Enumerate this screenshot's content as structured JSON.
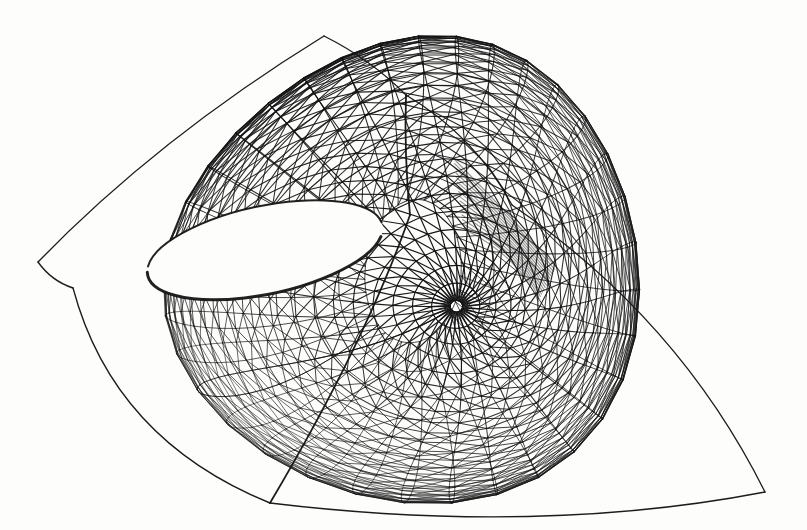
{
  "figure": {
    "domain_kind": "mathematical-surface-plot",
    "caption": "",
    "background_color": "#fdfdfc",
    "line_color": "#151515",
    "render_style": "wireframe-triangulated-quad-mesh",
    "scan_quality": "halftone-scan-grayscale"
  },
  "canvas": {
    "width": 807,
    "height": 530,
    "label": "surface-canvas"
  },
  "chart_data": {
    "type": "line",
    "subtitle": "",
    "xlabel": "",
    "ylabel": "",
    "grid": false,
    "legend": false,
    "axes_visible": false,
    "tick_labels": [],
    "projection": {
      "kind": "orthographic",
      "azimuth_deg": 34,
      "elevation_deg": 21,
      "roll_deg": 0,
      "scale": 196,
      "center_x": 404,
      "center_y": 268
    },
    "mesh": {
      "u_divisions": 34,
      "v_divisions": 34,
      "u_range": [
        -1.0,
        1.0
      ],
      "v_range": [
        -1.0,
        1.0
      ],
      "triangulation": "quad-split-forward-diagonal",
      "line_width": 1.0,
      "surface_family": "cross-cap-whitney-umbrella",
      "coefficients": {
        "a": 1.0,
        "b": 1.0,
        "c": 0.62,
        "twist": 1.0,
        "fold_gain": 0.86,
        "cusp_sharpness": 1.42
      }
    },
    "landmarks": [
      {
        "name": "upper-apex",
        "x": 324,
        "y": 36,
        "note": "highest peak of upper sheet"
      },
      {
        "name": "secondary-peak",
        "x": 406,
        "y": 95,
        "note": "second cusp ridge"
      },
      {
        "name": "left-upper-tip",
        "x": 38,
        "y": 262,
        "note": "sharp left cusp of upper sheet"
      },
      {
        "name": "left-lower-corner",
        "x": 73,
        "y": 288,
        "note": "left corner of lower sheet"
      },
      {
        "name": "fold-crease",
        "x": 512,
        "y": 205,
        "note": "dark compressed fold band"
      },
      {
        "name": "self-intersection",
        "x": 410,
        "y": 215,
        "note": "sheets cross here"
      },
      {
        "name": "bottom-corner",
        "x": 270,
        "y": 503,
        "note": "lower-left bottom vertex"
      },
      {
        "name": "right-tip",
        "x": 765,
        "y": 492,
        "note": "far right pinch tip"
      },
      {
        "name": "hole-center",
        "x": 265,
        "y": 250,
        "note": "white aperture between sheets"
      }
    ],
    "aperture": {
      "name": "white-hole",
      "center_x": 265,
      "center_y": 250,
      "radius_x": 120,
      "radius_y": 44,
      "rotation_deg": -12
    }
  }
}
